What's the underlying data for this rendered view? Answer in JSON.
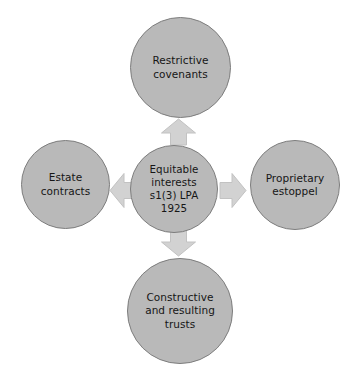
{
  "diagram": {
    "type": "hub-and-spoke",
    "center": {
      "id": "equitable-interests",
      "label": "Equitable\ninterests\ns1(3) LPA\n1925",
      "lines": [
        "Equitable",
        "interests",
        "s1(3) LPA",
        "1925"
      ]
    },
    "nodes": [
      {
        "id": "restrictive-covenants",
        "position": "top",
        "label": "Restrictive\ncovenants",
        "lines": [
          "Restrictive",
          "covenants"
        ]
      },
      {
        "id": "proprietary-estoppel",
        "position": "right",
        "label": "Proprietary\nestoppel",
        "lines": [
          "Proprietary",
          "estoppel"
        ]
      },
      {
        "id": "constructive-and-resulting-trusts",
        "position": "bottom",
        "label": "Constructive\nand resulting\ntrusts",
        "lines": [
          "Constructive",
          "and resulting",
          "trusts"
        ]
      },
      {
        "id": "estate-contracts",
        "position": "left",
        "label": "Estate\ncontracts",
        "lines": [
          "Estate",
          "contracts"
        ]
      }
    ],
    "arrows": [
      {
        "id": "arrow-up",
        "direction": "up",
        "from": "equitable-interests",
        "to": "restrictive-covenants"
      },
      {
        "id": "arrow-right",
        "direction": "right",
        "from": "equitable-interests",
        "to": "proprietary-estoppel"
      },
      {
        "id": "arrow-down",
        "direction": "down",
        "from": "equitable-interests",
        "to": "constructive-and-resulting-trusts"
      },
      {
        "id": "arrow-left",
        "direction": "left",
        "from": "equitable-interests",
        "to": "estate-contracts"
      }
    ],
    "colors": {
      "background": "#ffffff",
      "node_fill": "#b9b9b9",
      "node_stroke": "#7d7d7d",
      "arrow_fill": "#d2d2d2",
      "arrow_stroke": "#c2c2c2",
      "text": "#161616"
    }
  }
}
